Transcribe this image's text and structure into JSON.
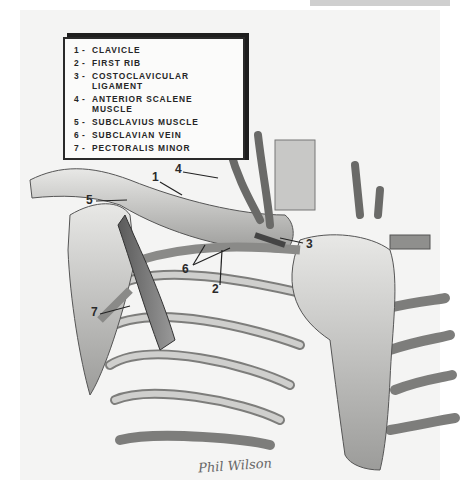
{
  "legend": {
    "items": [
      {
        "number": "1",
        "label": "CLAVICLE"
      },
      {
        "number": "2",
        "label": "FIRST RIB"
      },
      {
        "number": "3",
        "label": "COSTOCLAVICULAR LIGAMENT"
      },
      {
        "number": "4",
        "label": "ANTERIOR SCALENE MUSCLE"
      },
      {
        "number": "5",
        "label": "SUBCLAVIUS MUSCLE"
      },
      {
        "number": "6",
        "label": "SUBCLAVIAN VEIN"
      },
      {
        "number": "7",
        "label": "PECTORALIS MINOR"
      }
    ]
  },
  "callouts": [
    {
      "number": "1",
      "x": 152,
      "y": 178
    },
    {
      "number": "4",
      "x": 176,
      "y": 170
    },
    {
      "number": "5",
      "x": 88,
      "y": 198
    },
    {
      "number": "3",
      "x": 309,
      "y": 244
    },
    {
      "number": "6",
      "x": 185,
      "y": 267
    },
    {
      "number": "2",
      "x": 214,
      "y": 289
    },
    {
      "number": "7",
      "x": 93,
      "y": 312
    }
  ],
  "signature": "Phil Wilson",
  "colors": {
    "ink": "#2a2a2a",
    "paper": "#f4f4f3",
    "bone": "#d8d8d6",
    "shadow": "#7a7a7a"
  }
}
